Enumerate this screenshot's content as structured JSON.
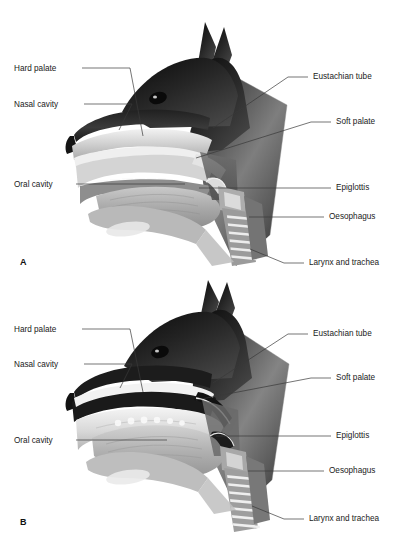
{
  "figure": {
    "background": "#ffffff",
    "width": 402,
    "height": 551,
    "leader_color": "#3a3a3a",
    "text_color": "#1a1a1a"
  },
  "panels": [
    {
      "id": "A",
      "letter": "A",
      "letter_pos": {
        "x": 20,
        "y": 263
      },
      "state_description": "normal breathing position, soft palate below epiglottis",
      "labels_left": [
        {
          "name": "hard-palate",
          "text": "Hard palate",
          "x": 14,
          "y": 70,
          "line": [
            [
              82,
              68
            ],
            [
              130,
              68
            ],
            [
              130,
              68
            ],
            [
              143,
              136
            ]
          ]
        },
        {
          "name": "nasal-cavity",
          "text": "Nasal cavity",
          "x": 14,
          "y": 106,
          "line": [
            [
              84,
              104
            ],
            [
              132,
              104
            ],
            [
              132,
              104
            ],
            [
              119,
              130
            ]
          ]
        },
        {
          "name": "oral-cavity",
          "text": "Oral cavity",
          "x": 14,
          "y": 186,
          "line": [
            [
              76,
              184
            ],
            [
              185,
              184
            ]
          ]
        }
      ],
      "labels_right": [
        {
          "name": "eustachian-tube",
          "text": "Eustachian tube",
          "x": 313,
          "y": 79,
          "line": [
            [
              308,
              77
            ],
            [
              288,
              77
            ],
            [
              288,
              77
            ],
            [
              213,
              128
            ]
          ]
        },
        {
          "name": "soft-palate",
          "text": "Soft palate",
          "x": 336,
          "y": 124,
          "line": [
            [
              331,
              122
            ],
            [
              311,
              122
            ],
            [
              311,
              122
            ],
            [
              196,
              158
            ]
          ]
        },
        {
          "name": "epiglottis",
          "text": "Epiglottis",
          "x": 336,
          "y": 190,
          "line": [
            [
              331,
              188
            ],
            [
              199,
              188
            ]
          ]
        },
        {
          "name": "oesophagus",
          "text": "Oesophagus",
          "x": 329,
          "y": 219,
          "line": [
            [
              324,
              217
            ],
            [
              249,
              217
            ]
          ]
        },
        {
          "name": "larynx-and-trachea",
          "text": "Larynx and trachea",
          "x": 309,
          "y": 265,
          "line": [
            [
              304,
              263
            ],
            [
              284,
              263
            ],
            [
              284,
              263
            ],
            [
              250,
              249
            ]
          ]
        }
      ]
    },
    {
      "id": "B",
      "letter": "B",
      "letter_pos": {
        "x": 20,
        "y": 523
      },
      "state_description": "swallowing position, soft palate elevated, epiglottis closing larynx",
      "labels_left": [
        {
          "name": "hard-palate",
          "text": "Hard palate",
          "x": 14,
          "y": 331,
          "line": [
            [
              82,
              329
            ],
            [
              130,
              329
            ],
            [
              130,
              329
            ],
            [
              143,
              392
            ]
          ]
        },
        {
          "name": "nasal-cavity",
          "text": "Nasal cavity",
          "x": 14,
          "y": 366,
          "line": [
            [
              84,
              364
            ],
            [
              132,
              364
            ],
            [
              132,
              364
            ],
            [
              120,
              388
            ]
          ]
        },
        {
          "name": "oral-cavity",
          "text": "Oral cavity",
          "x": 14,
          "y": 442,
          "line": [
            [
              76,
              440
            ],
            [
              167,
              440
            ]
          ]
        }
      ],
      "labels_right": [
        {
          "name": "eustachian-tube",
          "text": "Eustachian tube",
          "x": 313,
          "y": 336,
          "line": [
            [
              308,
              334
            ],
            [
              288,
              334
            ],
            [
              288,
              334
            ],
            [
              213,
              383
            ]
          ]
        },
        {
          "name": "soft-palate",
          "text": "Soft palate",
          "x": 336,
          "y": 380,
          "line": [
            [
              331,
              378
            ],
            [
              311,
              378
            ],
            [
              311,
              378
            ],
            [
              196,
              400
            ]
          ]
        },
        {
          "name": "epiglottis",
          "text": "Epiglottis",
          "x": 336,
          "y": 438,
          "line": [
            [
              331,
              436
            ],
            [
              216,
              436
            ]
          ]
        },
        {
          "name": "oesophagus",
          "text": "Oesophagus",
          "x": 329,
          "y": 473,
          "line": [
            [
              324,
              471
            ],
            [
              248,
              471
            ]
          ]
        },
        {
          "name": "larynx-and-trachea",
          "text": "Larynx and trachea",
          "x": 309,
          "y": 521,
          "line": [
            [
              304,
              519
            ],
            [
              284,
              519
            ],
            [
              284,
              519
            ],
            [
              252,
              506
            ]
          ]
        }
      ]
    }
  ]
}
